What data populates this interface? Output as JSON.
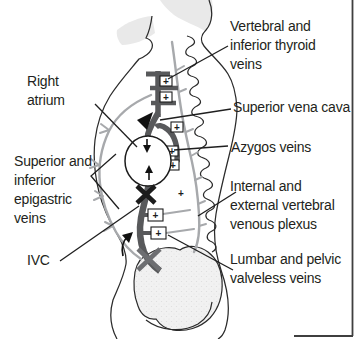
{
  "figure": {
    "type": "anatomical-diagram",
    "labels": {
      "vertebral_thyroid": "Vertebral and\ninferior thyroid\nveins",
      "right_atrium": "Right\natrium",
      "svc": "Superior vena cava",
      "azygos": "Azygos veins",
      "epigastric": "Superior and\ninferior\nepigastric\nveins",
      "ivc": "IVC",
      "vertebral_plexus": "Internal and\nexternal vertebral\nvenous plexus",
      "lumbar_pelvic": "Lumbar and pelvic\nvalveless veins"
    },
    "markers": {
      "valve_symbol": "+",
      "obstruction_symbol": "X",
      "flow_arrow_meaning": "direction of venous flow"
    },
    "colors": {
      "background": "#ffffff",
      "text": "#231f20",
      "outline": "#2b2b2b",
      "dark_vessel": "#58595b",
      "light_vessel": "#a7a9ac",
      "shade_fill": "#e9e9e9",
      "bone_fill": "#f1f1f1",
      "obstruction_upper": "#1c1c1c",
      "obstruction_lower": "#6d6e71",
      "frame": "#3f3f3f"
    }
  }
}
